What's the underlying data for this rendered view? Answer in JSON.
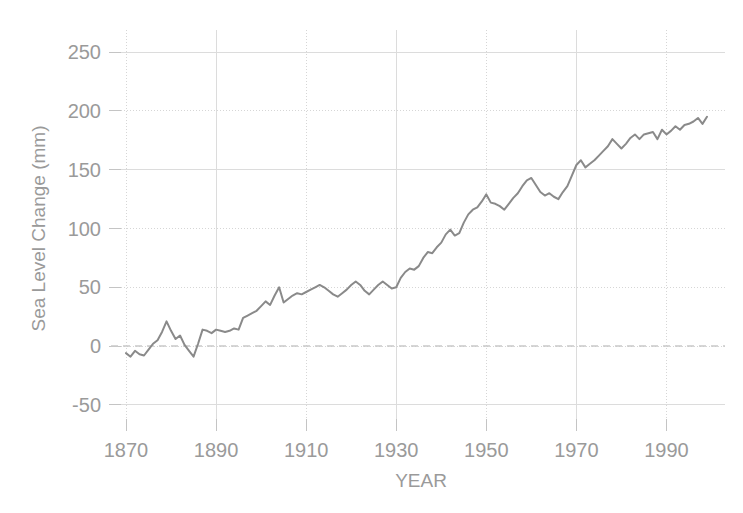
{
  "figure": {
    "kind": "line-chart",
    "background_color": "#ffffff",
    "line_color": "#8a8a8a",
    "grid_color": "#d6d6d6",
    "text_color": "#9a9a9a",
    "zero_line_color": "#c9c9c9"
  },
  "chart_data": {
    "type": "line",
    "title": "",
    "subtitle": "",
    "xlabel": "YEAR",
    "ylabel": "Sea Level Change (mm)",
    "xlim": [
      1868,
      2003
    ],
    "ylim": [
      -62,
      262
    ],
    "xticks": [
      1870,
      1890,
      1910,
      1930,
      1950,
      1970,
      1990
    ],
    "xtick_labels": [
      "1870",
      "1890",
      "1910",
      "1930",
      "1950",
      "1970",
      "1990"
    ],
    "yticks": [
      -50,
      0,
      50,
      100,
      150,
      200,
      250
    ],
    "ytick_labels": [
      "-50",
      "0",
      "50",
      "100",
      "150",
      "200",
      "250"
    ],
    "grid": true,
    "grid_style": "dotted-major",
    "legend": null,
    "annotations": [
      {
        "kind": "reference-line",
        "axis": "y",
        "value": 0,
        "style": "dashed",
        "label": ""
      }
    ],
    "series": [
      {
        "name": "Sea Level Change",
        "color": "#8a8a8a",
        "line_width": 2,
        "x": [
          1870,
          1871,
          1872,
          1873,
          1874,
          1875,
          1876,
          1877,
          1878,
          1879,
          1880,
          1881,
          1882,
          1883,
          1884,
          1885,
          1886,
          1887,
          1888,
          1889,
          1890,
          1891,
          1892,
          1893,
          1894,
          1895,
          1896,
          1897,
          1898,
          1899,
          1900,
          1901,
          1902,
          1903,
          1904,
          1905,
          1906,
          1907,
          1908,
          1909,
          1910,
          1911,
          1912,
          1913,
          1914,
          1915,
          1916,
          1917,
          1918,
          1919,
          1920,
          1921,
          1922,
          1923,
          1924,
          1925,
          1926,
          1927,
          1928,
          1929,
          1930,
          1931,
          1932,
          1933,
          1934,
          1935,
          1936,
          1937,
          1938,
          1939,
          1940,
          1941,
          1942,
          1943,
          1944,
          1945,
          1946,
          1947,
          1948,
          1949,
          1950,
          1951,
          1952,
          1953,
          1954,
          1955,
          1956,
          1957,
          1958,
          1959,
          1960,
          1961,
          1962,
          1963,
          1964,
          1965,
          1966,
          1967,
          1968,
          1969,
          1970,
          1971,
          1972,
          1973,
          1974,
          1975,
          1976,
          1977,
          1978,
          1979,
          1980,
          1981,
          1982,
          1983,
          1984,
          1985,
          1986,
          1987,
          1988,
          1989,
          1990,
          1991,
          1992,
          1993,
          1994,
          1995,
          1996,
          1997,
          1998,
          1999
        ],
        "y": [
          -6,
          -9,
          -4,
          -7,
          -8,
          -3,
          2,
          5,
          12,
          21,
          13,
          6,
          9,
          1,
          -4,
          -9,
          2,
          14,
          13,
          11,
          14,
          13,
          12,
          13,
          15,
          14,
          24,
          26,
          28,
          30,
          34,
          38,
          35,
          43,
          50,
          37,
          40,
          43,
          45,
          44,
          46,
          48,
          50,
          52,
          50,
          47,
          44,
          42,
          45,
          48,
          52,
          55,
          52,
          47,
          44,
          48,
          52,
          55,
          52,
          49,
          50,
          58,
          63,
          66,
          65,
          68,
          75,
          80,
          79,
          84,
          88,
          95,
          99,
          94,
          96,
          105,
          112,
          116,
          118,
          123,
          129,
          122,
          121,
          119,
          116,
          121,
          126,
          130,
          136,
          141,
          143,
          137,
          131,
          128,
          130,
          127,
          125,
          131,
          136,
          145,
          154,
          158,
          152,
          155,
          158,
          162,
          166,
          170,
          176,
          172,
          168,
          172,
          177,
          180,
          176,
          180,
          181,
          182,
          176,
          184,
          180,
          183,
          187,
          184,
          188,
          189,
          191,
          194,
          189,
          195
        ]
      }
    ]
  }
}
